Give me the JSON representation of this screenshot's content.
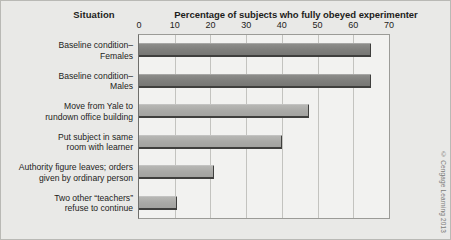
{
  "headers": {
    "situation": "Situation",
    "percentage": "Percentage of subjects who fully obeyed experimenter"
  },
  "credit": "© Cengage Learning 2013",
  "chart_data": {
    "type": "bar",
    "orientation": "horizontal",
    "title": "Percentage of subjects who fully obeyed experimenter",
    "xlabel": "Percentage of subjects who fully obeyed experimenter",
    "ylabel": "Situation",
    "xlim": [
      0,
      70
    ],
    "xticks": [
      0,
      10,
      20,
      30,
      40,
      50,
      60,
      70
    ],
    "tick_labels": [
      "0",
      "10",
      "20",
      "30",
      "40",
      "50",
      "60",
      "70"
    ],
    "grid": true,
    "legend": false,
    "categories": [
      "Baseline condition–\nFemales",
      "Baseline condition–\nMales",
      "Move from Yale to\nrundown office building",
      "Put subject in same\nroom with learner",
      "Authority figure leaves; orders\ngiven by ordinary person",
      "Two other “teachers”\nrefuse to continue"
    ],
    "values": [
      65,
      65,
      47.5,
      40,
      21,
      10.5
    ],
    "bars": [
      {
        "label_line1": "Baseline condition–",
        "label_line2": "Females",
        "value": 65,
        "shade": "dark"
      },
      {
        "label_line1": "Baseline condition–",
        "label_line2": "Males",
        "value": 65,
        "shade": "dark"
      },
      {
        "label_line1": "Move from Yale to",
        "label_line2": "rundown office building",
        "value": 47.5,
        "shade": "light"
      },
      {
        "label_line1": "Put subject in same",
        "label_line2": "room with learner",
        "value": 40,
        "shade": "light"
      },
      {
        "label_line1": "Authority figure leaves; orders",
        "label_line2": "given by ordinary person",
        "value": 21,
        "shade": "light"
      },
      {
        "label_line1": "Two other “teachers”",
        "label_line2": "refuse to continue",
        "value": 10.5,
        "shade": "light"
      }
    ],
    "colors": {
      "bar_dark": "#7e7e7b",
      "bar_light": "#a9a9a6",
      "background": "#e9e9e7",
      "plot_background": "#f2f2f0",
      "gridline": "#c3c3bf",
      "text": "#1d1d1b"
    }
  }
}
